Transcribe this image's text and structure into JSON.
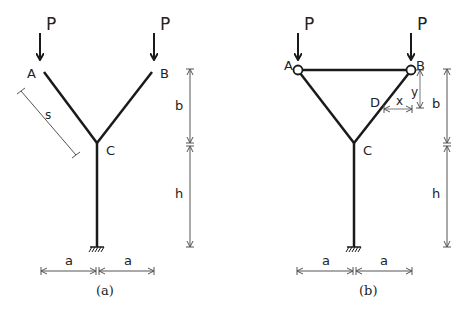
{
  "figure_a": {
    "caption": "(a)",
    "load_label_left": "P",
    "load_label_right": "P",
    "node_a": "A",
    "node_b": "B",
    "node_c": "C",
    "dim_s": "s",
    "dim_b": "b",
    "dim_h": "h",
    "dim_a_left": "a",
    "dim_a_right": "a"
  },
  "figure_b": {
    "caption": "(b)",
    "load_label_left": "P",
    "load_label_right": "P",
    "node_a": "A",
    "node_b": "B",
    "node_c": "C",
    "node_d": "D",
    "dim_x": "x",
    "dim_y": "y",
    "dim_b": "b",
    "dim_h": "h",
    "dim_a_left": "a",
    "dim_a_right": "a"
  },
  "colors": {
    "member": "#1a1a1a",
    "dimension": "#555555",
    "background": "#ffffff"
  }
}
